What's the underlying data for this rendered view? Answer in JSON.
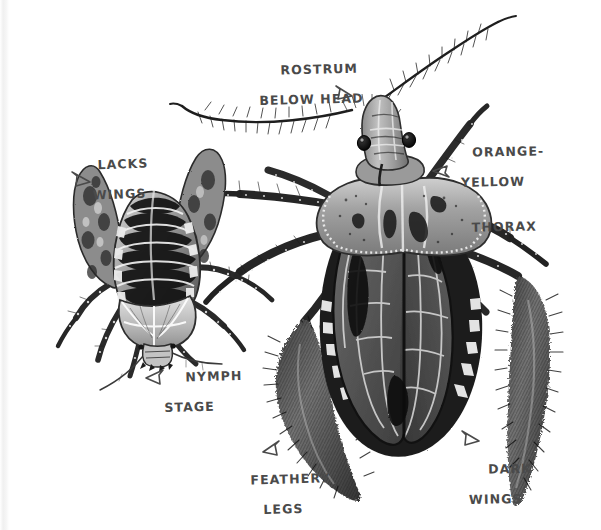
{
  "illustration": {
    "title": "Kissing bug (triatomine) anatomy plate",
    "medium": "graphite-and-ink scientific illustration",
    "background_color": "#ffffff",
    "ink_color": "#4a4a4a",
    "subjects": [
      {
        "name": "nymph",
        "position": "left",
        "description": "wingless immature kissing bug with banded striped abdomen"
      },
      {
        "name": "adult",
        "position": "right",
        "description": "winged adult kissing bug with orange-yellow thorax and dark wings"
      }
    ]
  },
  "labels": [
    {
      "id": "rostrum",
      "line1": "ROSTRUM",
      "line2": "BELOW HEAD",
      "arrow": "arrow-down-right",
      "points_to": "adult-head"
    },
    {
      "id": "thorax",
      "line1": "ORANGE-",
      "line2": "YELLOW",
      "line3": "THORAX",
      "arrow": "arrow-left",
      "points_to": "adult-thorax"
    },
    {
      "id": "lacks_wings",
      "line1": "LACKS",
      "line2": "WINGS",
      "arrow": "arrow-down-right",
      "points_to": "nymph-back"
    },
    {
      "id": "nymph_stage",
      "line1": "NYMPH",
      "line2": "STAGE",
      "arrow": "arrow-up-right",
      "points_to": "nymph-body"
    },
    {
      "id": "feathery_legs",
      "line1": "FEATHERY",
      "line2": "LEGS",
      "arrow": "arrow-up-right",
      "points_to": "adult-hind-leg-tuft"
    },
    {
      "id": "dark_wings",
      "line1": "DARK",
      "line2": "WINGS",
      "arrow": "arrow-up-left",
      "points_to": "adult-wings"
    }
  ],
  "palette": {
    "paper": "#ffffff",
    "ink": "#4a4a4a",
    "wing_dark": "#5c5c5c",
    "wing_darkest": "#161616",
    "thorax_mid": "#8d8d8d",
    "thorax_light": "#c9c9c9",
    "leg_dark": "#2a2a2a",
    "edge_band": "#f0f0f0"
  }
}
